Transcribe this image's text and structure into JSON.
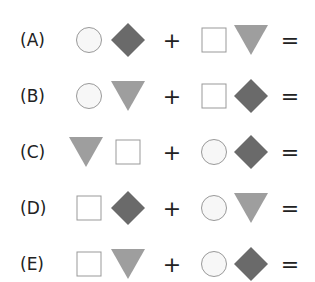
{
  "options": [
    {
      "label": "(A)",
      "left": [
        "circle",
        "diamond"
      ],
      "right": [
        "square",
        "triangle"
      ]
    },
    {
      "label": "(B)",
      "left": [
        "circle",
        "triangle"
      ],
      "right": [
        "square",
        "diamond"
      ]
    },
    {
      "label": "(C)",
      "left": [
        "triangle",
        "square"
      ],
      "right": [
        "circle",
        "diamond"
      ]
    },
    {
      "label": "(D)",
      "left": [
        "square",
        "diamond"
      ],
      "right": [
        "circle",
        "triangle"
      ]
    },
    {
      "label": "(E)",
      "left": [
        "square",
        "triangle"
      ],
      "right": [
        "circle",
        "diamond"
      ]
    }
  ],
  "operators": {
    "plus": "+",
    "equals": "="
  },
  "colors": {
    "diamond": "#6a6a6a",
    "triangle": "#9e9e9e",
    "outline": "#999999",
    "circle_fill": "#f7f7f7"
  }
}
